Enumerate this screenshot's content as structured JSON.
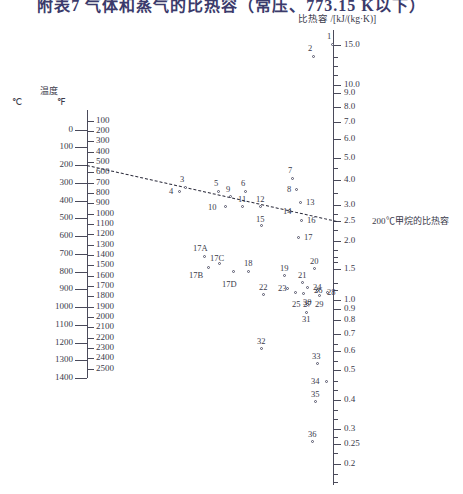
{
  "title": "附表7  气体和蒸气的比热容（常压、773.15 K以下）",
  "left_axis": {
    "name": "温度",
    "unit_c": "℃",
    "unit_f": "℉",
    "c_labels": [
      "0",
      "100",
      "200",
      "300",
      "400",
      "500",
      "600",
      "700",
      "800",
      "900",
      "1000",
      "1100",
      "1200",
      "1300",
      "1400"
    ],
    "f_labels": [
      "100",
      "200",
      "300",
      "400",
      "500",
      "600",
      "700",
      "800",
      "900",
      "1000",
      "1100",
      "1200",
      "1300",
      "1400",
      "1500",
      "1600",
      "1700",
      "1800",
      "1900",
      "2000",
      "2100",
      "2200",
      "2300",
      "2400",
      "2500"
    ]
  },
  "right_axis": {
    "header": "比热容 /[kJ/(kg·K)]",
    "labels": [
      "15.0",
      "10.0",
      "9.0",
      "8.0",
      "7.0",
      "6.0",
      "5.0",
      "4.0",
      "3.0",
      "2.5",
      "2.0",
      "1.5",
      "1.0",
      "0.9",
      "0.8",
      "0.7",
      "0.6",
      "0.5",
      "0.4",
      "0.3",
      "0.25",
      "0.2"
    ]
  },
  "annotation": "200℃甲烷的比热容",
  "chart_data": {
    "type": "scatter",
    "title": "附表7  气体和蒸气的比热容（常压、773.15 K以下）",
    "xlabel": "",
    "ylabel": "比热容 /[kJ/(kg·K)]",
    "grid": false,
    "legend": "none",
    "left_scale_c": [
      0,
      1400
    ],
    "left_scale_f": [
      100,
      2500
    ],
    "right_scale": [
      0.2,
      15.0
    ],
    "alignment_line": {
      "from_label": "200℃",
      "to_label": "2.5",
      "note": "200℃甲烷的比热容"
    },
    "points": [
      {
        "id": "1",
        "x": 333,
        "y": 45,
        "lx": 327,
        "ly": 32
      },
      {
        "id": "2",
        "x": 314,
        "y": 57,
        "lx": 308,
        "ly": 44
      },
      {
        "id": "3",
        "x": 186,
        "y": 188,
        "lx": 180,
        "ly": 175
      },
      {
        "id": "4",
        "x": 180,
        "y": 192,
        "lx": 169,
        "ly": 187
      },
      {
        "id": "5",
        "x": 219,
        "y": 192,
        "lx": 214,
        "ly": 179
      },
      {
        "id": "6",
        "x": 246,
        "y": 192,
        "lx": 241,
        "ly": 179
      },
      {
        "id": "7",
        "x": 293,
        "y": 179,
        "lx": 288,
        "ly": 166
      },
      {
        "id": "8",
        "x": 297,
        "y": 190,
        "lx": 287,
        "ly": 185
      },
      {
        "id": "9",
        "x": 231,
        "y": 197,
        "lx": 226,
        "ly": 185
      },
      {
        "id": "10",
        "x": 226,
        "y": 207,
        "lx": 208,
        "ly": 203
      },
      {
        "id": "11",
        "x": 243,
        "y": 207,
        "lx": 238,
        "ly": 195
      },
      {
        "id": "12",
        "x": 261,
        "y": 207,
        "lx": 256,
        "ly": 195
      },
      {
        "id": "13",
        "x": 301,
        "y": 203,
        "lx": 306,
        "ly": 198
      },
      {
        "id": "14",
        "x": 290,
        "y": 211,
        "lx": 283,
        "ly": 207
      },
      {
        "id": "15",
        "x": 262,
        "y": 226,
        "lx": 256,
        "ly": 215
      },
      {
        "id": "16",
        "x": 302,
        "y": 221,
        "lx": 307,
        "ly": 216
      },
      {
        "id": "17",
        "x": 299,
        "y": 238,
        "lx": 304,
        "ly": 233
      },
      {
        "id": "17A",
        "x": 205,
        "y": 257,
        "lx": 193,
        "ly": 244
      },
      {
        "id": "17B",
        "x": 209,
        "y": 268,
        "lx": 189,
        "ly": 271
      },
      {
        "id": "17C",
        "x": 220,
        "y": 264,
        "lx": 210,
        "ly": 254
      },
      {
        "id": "17D",
        "x": 234,
        "y": 272,
        "lx": 222,
        "ly": 280
      },
      {
        "id": "18",
        "x": 249,
        "y": 272,
        "lx": 244,
        "ly": 259
      },
      {
        "id": "19",
        "x": 285,
        "y": 276,
        "lx": 280,
        "ly": 264
      },
      {
        "id": "20",
        "x": 315,
        "y": 269,
        "lx": 310,
        "ly": 257
      },
      {
        "id": "21",
        "x": 303,
        "y": 283,
        "lx": 298,
        "ly": 271
      },
      {
        "id": "22",
        "x": 264,
        "y": 295,
        "lx": 259,
        "ly": 283
      },
      {
        "id": "23",
        "x": 288,
        "y": 289,
        "lx": 278,
        "ly": 284
      },
      {
        "id": "24",
        "x": 308,
        "y": 288,
        "lx": 313,
        "ly": 283
      },
      {
        "id": "25",
        "x": 296,
        "y": 293,
        "lx": 292,
        "ly": 300
      },
      {
        "id": "26",
        "x": 318,
        "y": 291,
        "lx": 314,
        "ly": 286
      },
      {
        "id": "27",
        "x": 304,
        "y": 294,
        "lx": 303,
        "ly": 300
      },
      {
        "id": "28",
        "x": 328,
        "y": 293,
        "lx": 327,
        "ly": 288
      },
      {
        "id": "29",
        "x": 320,
        "y": 296,
        "lx": 315,
        "ly": 300
      },
      {
        "id": "30",
        "x": 308,
        "y": 305,
        "lx": 303,
        "ly": 298
      },
      {
        "id": "31",
        "x": 307,
        "y": 313,
        "lx": 302,
        "ly": 315
      },
      {
        "id": "32",
        "x": 262,
        "y": 349,
        "lx": 257,
        "ly": 337
      },
      {
        "id": "33",
        "x": 318,
        "y": 364,
        "lx": 312,
        "ly": 352
      },
      {
        "id": "34",
        "x": 327,
        "y": 382,
        "lx": 311,
        "ly": 377
      },
      {
        "id": "35",
        "x": 316,
        "y": 402,
        "lx": 311,
        "ly": 390
      },
      {
        "id": "36",
        "x": 313,
        "y": 442,
        "lx": 308,
        "ly": 430
      }
    ]
  }
}
